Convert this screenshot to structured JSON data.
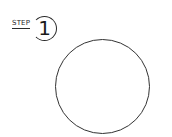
{
  "step": {
    "label": "STEP",
    "number": "1"
  },
  "shape": {
    "type": "circle",
    "stroke_color": "#333333",
    "fill_color": "#ffffff"
  }
}
